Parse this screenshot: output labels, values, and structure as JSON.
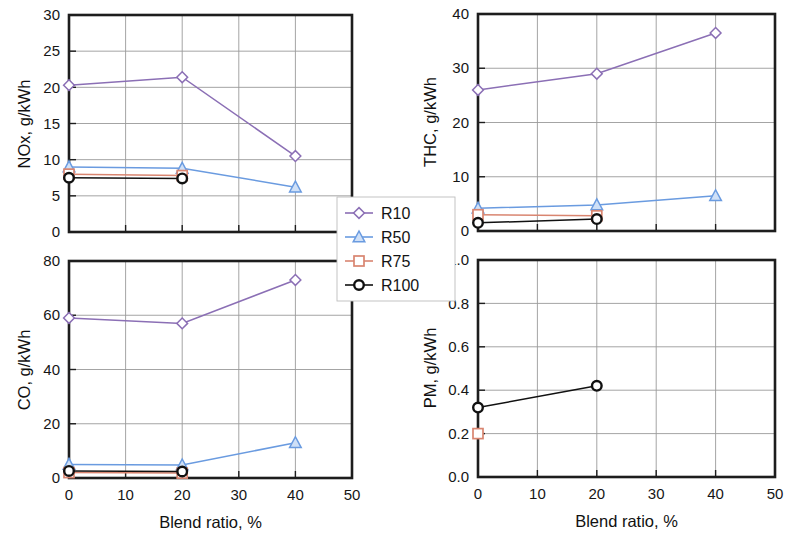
{
  "figure": {
    "width": 792,
    "height": 536,
    "background": "#ffffff"
  },
  "legend": {
    "position": "center",
    "entries": [
      {
        "label": "R10",
        "color": "#8b6fb5",
        "marker": "diamond"
      },
      {
        "label": "R50",
        "color": "#6a9be0",
        "marker": "triangle"
      },
      {
        "label": "R75",
        "color": "#d98570",
        "marker": "square"
      },
      {
        "label": "R100",
        "color": "#111111",
        "marker": "circle"
      }
    ]
  },
  "colors": {
    "r10": "#8b6fb5",
    "r50": "#6a9be0",
    "r75": "#d98570",
    "r100": "#111111",
    "axis": "#1d1d1d",
    "grid": "#9a9a9a"
  },
  "shared": {
    "xlabel": "Blend ratio, %",
    "xticks": [
      0,
      10,
      20,
      30,
      40,
      50
    ],
    "xlim": [
      0,
      50
    ]
  },
  "chart_data": [
    {
      "id": "nox",
      "type": "line",
      "title": "",
      "xlabel": "Blend ratio, %",
      "ylabel": "NOx, g/kWh",
      "xlim": [
        0,
        50
      ],
      "ylim": [
        0,
        30
      ],
      "xticks": [
        0,
        10,
        20,
        30,
        40,
        50
      ],
      "yticks": [
        0,
        5,
        10,
        15,
        20,
        25,
        30
      ],
      "grid": true,
      "legend": "shared",
      "series": [
        {
          "name": "R10",
          "marker": "diamond",
          "color": "#8b6fb5",
          "x": [
            0,
            20,
            40
          ],
          "values": [
            20.3,
            21.4,
            10.5
          ]
        },
        {
          "name": "R50",
          "marker": "triangle",
          "color": "#6a9be0",
          "x": [
            0,
            20,
            40
          ],
          "values": [
            9.0,
            8.8,
            6.2
          ]
        },
        {
          "name": "R75",
          "marker": "square",
          "color": "#d98570",
          "x": [
            0,
            20
          ],
          "values": [
            8.0,
            7.8
          ]
        },
        {
          "name": "R100",
          "marker": "circle",
          "color": "#111111",
          "x": [
            0,
            20
          ],
          "values": [
            7.5,
            7.4
          ]
        }
      ]
    },
    {
      "id": "thc",
      "type": "line",
      "title": "",
      "xlabel": "Blend ratio, %",
      "ylabel": "THC, g/kWh",
      "xlim": [
        0,
        50
      ],
      "ylim": [
        0,
        40
      ],
      "xticks": [
        0,
        10,
        20,
        30,
        40,
        50
      ],
      "yticks": [
        0,
        10,
        20,
        30,
        40
      ],
      "grid": true,
      "legend": "shared",
      "series": [
        {
          "name": "R10",
          "marker": "diamond",
          "color": "#8b6fb5",
          "x": [
            0,
            20,
            40
          ],
          "values": [
            26.0,
            29.0,
            36.5
          ]
        },
        {
          "name": "R50",
          "marker": "triangle",
          "color": "#6a9be0",
          "x": [
            0,
            20,
            40
          ],
          "values": [
            4.2,
            4.8,
            6.5
          ]
        },
        {
          "name": "R75",
          "marker": "square",
          "color": "#d98570",
          "x": [
            0,
            20
          ],
          "values": [
            3.0,
            2.8
          ]
        },
        {
          "name": "R100",
          "marker": "circle",
          "color": "#111111",
          "x": [
            0,
            20
          ],
          "values": [
            1.5,
            2.2
          ]
        }
      ]
    },
    {
      "id": "co",
      "type": "line",
      "title": "",
      "xlabel": "Blend ratio, %",
      "ylabel": "CO, g/kWh",
      "xlim": [
        0,
        50
      ],
      "ylim": [
        0,
        80
      ],
      "xticks": [
        0,
        10,
        20,
        30,
        40,
        50
      ],
      "yticks": [
        0,
        20,
        40,
        60,
        80
      ],
      "grid": true,
      "legend": "shared",
      "series": [
        {
          "name": "R10",
          "marker": "diamond",
          "color": "#8b6fb5",
          "x": [
            0,
            20,
            40
          ],
          "values": [
            59.0,
            57.0,
            73.0
          ]
        },
        {
          "name": "R50",
          "marker": "triangle",
          "color": "#6a9be0",
          "x": [
            0,
            20,
            40
          ],
          "values": [
            5.0,
            4.8,
            13.0
          ]
        },
        {
          "name": "R75",
          "marker": "square",
          "color": "#d98570",
          "x": [
            0,
            20
          ],
          "values": [
            2.0,
            1.8
          ]
        },
        {
          "name": "R100",
          "marker": "circle",
          "color": "#111111",
          "x": [
            0,
            20
          ],
          "values": [
            2.6,
            2.4
          ]
        }
      ]
    },
    {
      "id": "pm",
      "type": "line",
      "title": "",
      "xlabel": "Blend ratio, %",
      "ylabel": "PM, g/kWh",
      "xlim": [
        0,
        50
      ],
      "ylim": [
        0,
        1.0
      ],
      "xticks": [
        0,
        10,
        20,
        30,
        40,
        50
      ],
      "yticks": [
        0.0,
        0.2,
        0.4,
        0.6,
        0.8,
        1.0
      ],
      "ytick_labels": [
        "0.0",
        "0.2",
        "0.4",
        "0.6",
        "0.8",
        "1.0"
      ],
      "grid": true,
      "legend": "shared",
      "series": [
        {
          "name": "R75",
          "marker": "square",
          "color": "#d98570",
          "x": [
            0
          ],
          "values": [
            0.2
          ]
        },
        {
          "name": "R100",
          "marker": "circle",
          "color": "#111111",
          "x": [
            0,
            20
          ],
          "values": [
            0.32,
            0.42
          ]
        }
      ]
    }
  ]
}
